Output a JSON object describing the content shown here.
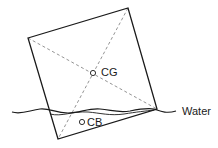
{
  "diagram": {
    "box": {
      "corners": [
        [
          28,
          38
        ],
        [
          128,
          8
        ],
        [
          157,
          109
        ],
        [
          58,
          139
        ]
      ],
      "stroke": "#1a1a1a"
    },
    "diagonals": {
      "style": "dashed",
      "stroke": "#888888"
    },
    "centre_of_gravity": {
      "label": "CG",
      "x": 93,
      "y": 73
    },
    "centre_of_buoyancy": {
      "label": "CB",
      "x": 82,
      "y": 122
    },
    "waterline": {
      "label": "Water",
      "stroke": "#1a1a1a"
    }
  }
}
